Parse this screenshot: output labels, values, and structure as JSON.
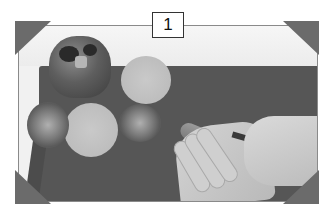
{
  "figure": {
    "step_number": "1",
    "colors": {
      "board": "#565656",
      "background": "#f1f1f1",
      "photo_corners": "#6b6b6b",
      "label_border": "#333333"
    }
  }
}
